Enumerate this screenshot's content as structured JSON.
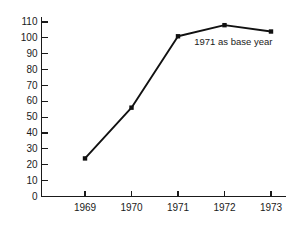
{
  "chart_data": {
    "type": "line",
    "title": "",
    "subtitle": "",
    "xlabel": "",
    "ylabel": "",
    "categories": [
      "1969",
      "1970",
      "1971",
      "1972",
      "1973"
    ],
    "x": [
      1969,
      1970,
      1971,
      1972,
      1973
    ],
    "values": [
      24,
      56,
      101,
      108,
      104
    ],
    "series": [
      {
        "name": "index",
        "values": [
          24,
          56,
          101,
          108,
          104
        ]
      }
    ],
    "ylim": [
      0,
      110
    ],
    "xlim": [
      1968.6,
      1973.5
    ],
    "ytick_labels": [
      "0",
      "10",
      "20",
      "30",
      "40",
      "50",
      "60",
      "70",
      "80",
      "90",
      "100",
      "110"
    ],
    "ytick_values": [
      0,
      10,
      20,
      30,
      40,
      50,
      60,
      70,
      80,
      90,
      100,
      110
    ],
    "xtick_labels": [
      "1969",
      "1970",
      "1971",
      "1972",
      "1973"
    ],
    "grid": false,
    "legend": false,
    "legend_position": "none",
    "marker": "square-dot",
    "line_color": "#111111",
    "marker_color": "#111111",
    "axis_color": "#1a1a1a",
    "background_color": "#ffffff",
    "annotations": [
      {
        "text": "1971 as base year",
        "x": 1971.35,
        "y": 97
      }
    ]
  }
}
